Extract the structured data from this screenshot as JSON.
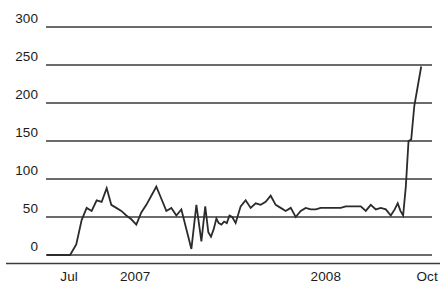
{
  "chart_data": {
    "type": "line",
    "title": "",
    "subtitle": "",
    "xlabel": "",
    "ylabel": "",
    "xlim": [
      0,
      100
    ],
    "ylim": [
      0,
      300
    ],
    "grid": true,
    "legend": null,
    "y_ticks": [
      {
        "value": 300,
        "label": "300"
      },
      {
        "value": 250,
        "label": "250"
      },
      {
        "value": 200,
        "label": "200"
      },
      {
        "value": 150,
        "label": "150"
      },
      {
        "value": 100,
        "label": "100"
      },
      {
        "value": 50,
        "label": "50"
      },
      {
        "value": 0,
        "label": "0"
      }
    ],
    "x_ticks": [
      {
        "x": 4.5,
        "label": "Jul"
      },
      {
        "x": 20.0,
        "label": "2007"
      },
      {
        "x": 69.5,
        "label": "2008"
      },
      {
        "x": 97.0,
        "label": "Oct"
      }
    ],
    "series": [
      {
        "name": "series-1",
        "color": "#2b2b2b",
        "x": [
          0.0,
          2.0,
          4.3,
          6.0,
          7.6,
          9.0,
          10.3,
          11.6,
          12.9,
          14.2,
          15.5,
          16.7,
          18.0,
          19.3,
          20.6,
          21.9,
          23.2,
          24.5,
          25.8,
          27.1,
          28.4,
          29.7,
          31.0,
          32.3,
          33.6,
          34.9,
          36.2,
          37.5,
          38.8,
          40.1,
          41.1,
          41.9,
          42.6,
          43.3,
          44.0,
          44.6,
          45.3,
          46.0,
          46.7,
          47.4,
          48.1,
          49.0,
          50.3,
          51.6,
          52.9,
          54.2,
          55.5,
          56.8,
          58.1,
          59.4,
          60.7,
          62.0,
          63.3,
          64.6,
          65.9,
          67.2,
          68.5,
          69.8,
          71.1,
          72.4,
          73.7,
          75.0,
          76.3,
          77.6,
          78.9,
          80.2,
          81.5,
          82.8,
          84.1,
          85.4,
          86.7,
          88.0,
          89.3,
          90.3,
          91.1,
          91.8,
          92.5,
          93.2,
          93.9,
          94.6,
          95.4,
          96.3,
          97.2
        ],
        "y": [
          0,
          0,
          0,
          0,
          14,
          46,
          62,
          58,
          72,
          70,
          88,
          66,
          62,
          58,
          52,
          47,
          40,
          56,
          66,
          78,
          90,
          74,
          58,
          62,
          52,
          60,
          34,
          8,
          66,
          18,
          64,
          30,
          24,
          34,
          48,
          42,
          40,
          44,
          42,
          52,
          50,
          42,
          64,
          72,
          62,
          68,
          66,
          70,
          78,
          66,
          62,
          58,
          62,
          50,
          58,
          62,
          60,
          60,
          62,
          62,
          62,
          62,
          62,
          64,
          64,
          64,
          64,
          58,
          66,
          60,
          62,
          60,
          52,
          60,
          68,
          58,
          52,
          90,
          150,
          152,
          196,
          222,
          248
        ]
      }
    ]
  }
}
